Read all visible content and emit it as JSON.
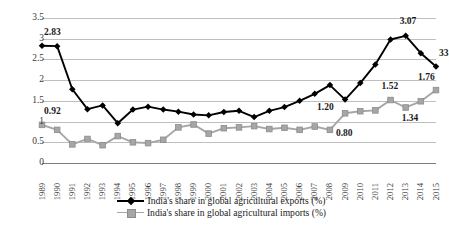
{
  "chart_data": {
    "type": "line",
    "title": "",
    "xlabel": "",
    "ylabel": "",
    "ylim": [
      0,
      3.5
    ],
    "yticks": [
      "0",
      "0.5",
      "1",
      "1.5",
      "2",
      "2.5",
      "3",
      "3.5"
    ],
    "grid": true,
    "legend_position": "bottom",
    "categories": [
      "1989",
      "1990",
      "1991",
      "1992",
      "1993",
      "1994",
      "1995",
      "1996",
      "1997",
      "1998",
      "1999",
      "2000",
      "2001",
      "2002",
      "2003",
      "2004",
      "2005",
      "2006",
      "2007",
      "2008",
      "2009",
      "2010",
      "2011",
      "2012",
      "2013",
      "2014",
      "2015"
    ],
    "series": [
      {
        "name": "India's share in global agricultural exports (%)",
        "color": "#000000",
        "marker": "diamond",
        "values": [
          2.83,
          2.82,
          1.78,
          1.3,
          1.39,
          0.96,
          1.29,
          1.36,
          1.29,
          1.24,
          1.17,
          1.15,
          1.23,
          1.26,
          1.11,
          1.26,
          1.35,
          1.5,
          1.67,
          1.88,
          1.53,
          1.93,
          2.38,
          2.98,
          3.07,
          2.65,
          2.33
        ]
      },
      {
        "name": "India's share in global agricultural imports (%)",
        "color": "#a6a6a6",
        "marker": "square",
        "values": [
          0.92,
          0.8,
          0.45,
          0.58,
          0.43,
          0.65,
          0.5,
          0.48,
          0.56,
          0.86,
          0.93,
          0.71,
          0.84,
          0.86,
          0.89,
          0.82,
          0.85,
          0.8,
          0.88,
          0.8,
          1.2,
          1.25,
          1.27,
          1.52,
          1.34,
          1.49,
          1.76
        ]
      }
    ],
    "annotations": [
      {
        "text": "2.83",
        "year": "1989",
        "series": "exports",
        "dx": 2,
        "dy": -13
      },
      {
        "text": "0.92",
        "year": "1989",
        "series": "imports",
        "dx": 2,
        "dy": -13
      },
      {
        "text": "3.07",
        "year": "2013",
        "series": "exports",
        "dx": -6,
        "dy": -14
      },
      {
        "text": "33",
        "year": "2015",
        "series": "exports",
        "dx": 3,
        "dy": -12
      },
      {
        "text": "1.20",
        "year": "2009",
        "series": "imports",
        "dx": -28,
        "dy": -5
      },
      {
        "text": "0.80",
        "year": "2008",
        "series": "imports",
        "dx": 6,
        "dy": 4
      },
      {
        "text": "1.52",
        "year": "2012",
        "series": "imports",
        "dx": -9,
        "dy": -13
      },
      {
        "text": "1.34",
        "year": "2013",
        "series": "imports",
        "dx": -4,
        "dy": 12
      },
      {
        "text": "1.76",
        "year": "2015",
        "series": "imports",
        "dx": -18,
        "dy": -12
      }
    ]
  }
}
